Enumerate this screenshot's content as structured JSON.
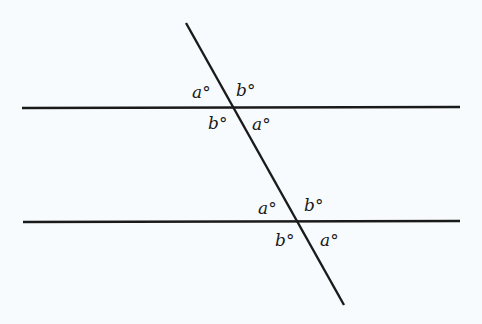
{
  "diagram": {
    "colors": {
      "background": "#f7fbfd",
      "ink": "#1a1a1a"
    },
    "lines": {
      "top_parallel": {
        "x1": 22,
        "y1": 108,
        "x2": 460,
        "y2": 107
      },
      "bottom_parallel": {
        "x1": 23,
        "y1": 222,
        "x2": 460,
        "y2": 221
      },
      "transversal": {
        "x1": 186,
        "y1": 23,
        "x2": 344,
        "y2": 305
      }
    },
    "top_intersection": {
      "upper_left": "a°",
      "upper_right": "b°",
      "lower_left": "b°",
      "lower_right": "a°"
    },
    "bottom_intersection": {
      "upper_left": "a°",
      "upper_right": "b°",
      "lower_left": "b°",
      "lower_right": "a°"
    }
  }
}
